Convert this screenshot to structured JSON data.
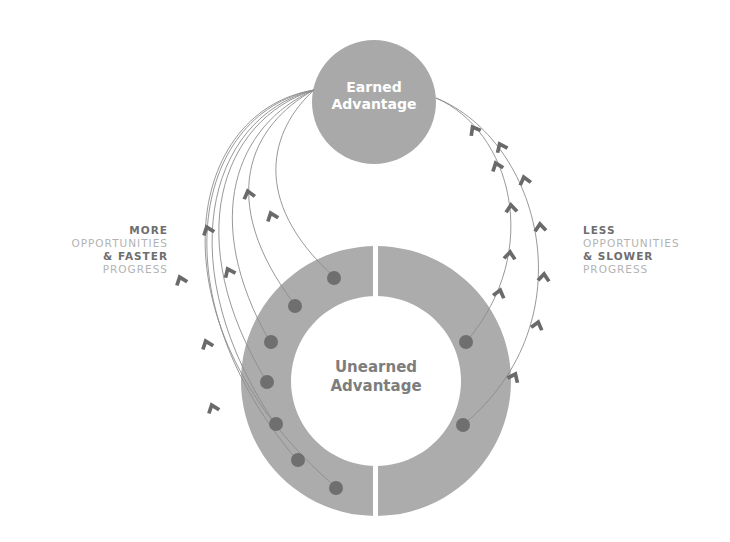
{
  "diagram": {
    "top_circle": {
      "line1": "Earned",
      "line2": "Advantage"
    },
    "bottom_ring": {
      "line1": "Unearned",
      "line2": "Advantage"
    },
    "left_label": {
      "line1": "MORE",
      "line2": "OPPORTUNITIES",
      "line3": "& FASTER",
      "line4": "PROGRESS"
    },
    "right_label": {
      "line1": "LESS",
      "line2": "OPPORTUNITIES",
      "line3": "& SLOWER",
      "line4": "PROGRESS"
    },
    "left_path_count": 7,
    "right_path_count": 2,
    "colors": {
      "circle_fill": "#a9a9a9",
      "ring_fill": "#acacac",
      "dot_fill": "#6f6f6f",
      "path_stroke": "#8c8c8c",
      "arrow_fill": "#6a6a6a",
      "dark_text": "#6e6e6e",
      "light_text": "#b3b3b3"
    }
  }
}
